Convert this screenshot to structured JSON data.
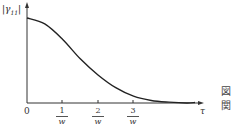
{
  "chart_data": {
    "type": "line",
    "title": "",
    "xlabel": "τ",
    "ylabel": "|γ11|",
    "x_ticks": [
      {
        "label": "0",
        "value": 0
      },
      {
        "label": "1/w",
        "num": "1",
        "den": "w",
        "value": 1
      },
      {
        "label": "2/w",
        "num": "2",
        "den": "w",
        "value": 2
      },
      {
        "label": "3/w",
        "num": "3",
        "den": "w",
        "value": 3
      }
    ],
    "x": [
      0,
      0.5,
      1,
      1.5,
      2,
      2.5,
      3,
      3.5,
      4,
      4.5
    ],
    "series": [
      {
        "name": "|γ11|",
        "values": [
          1.0,
          0.93,
          0.75,
          0.52,
          0.33,
          0.18,
          0.08,
          0.03,
          0.01,
          0.0
        ]
      }
    ],
    "xlim": [
      0,
      4.8
    ],
    "ylim": [
      0,
      1.1
    ],
    "grid": false,
    "legend": "none"
  },
  "labels": {
    "y_axis": "|γ",
    "y_sub": "11",
    "y_close": "|",
    "x_axis": "τ",
    "origin": "0"
  },
  "side_glyphs": [
    "図",
    "関"
  ]
}
